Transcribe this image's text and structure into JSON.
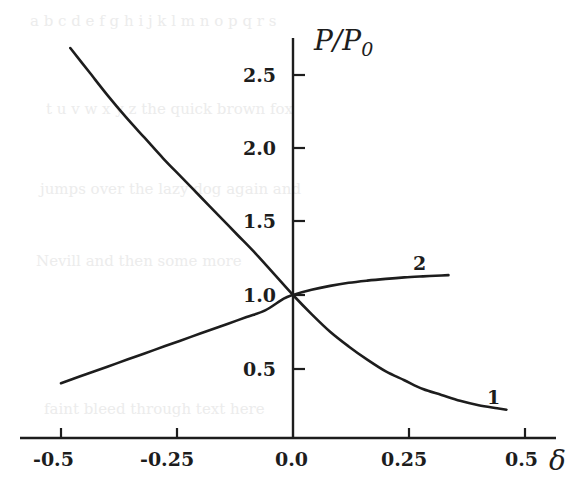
{
  "figure": {
    "background_color": "#ffffff",
    "ink_color": "#1d1d1d",
    "ghost_text_color": "#ececec"
  },
  "axes": {
    "y_title": "P/P",
    "y_title_subscript": "0",
    "x_title": "δ"
  },
  "curve_labels": {
    "curve1": "1",
    "curve2": "2"
  },
  "ghost_lines": [
    "a b c d e f g h i j k l m n o p q r s",
    "t u v w x y z the quick brown fox",
    "jumps over the lazy dog again and",
    "Nevill   and   then   some   more",
    "faint   bleed   through   text   here"
  ],
  "chart_data": {
    "type": "line",
    "title": "",
    "xlabel": "δ",
    "ylabel": "P/P0",
    "xlim": [
      -0.55,
      0.58
    ],
    "ylim": [
      0.0,
      2.8
    ],
    "xticks": [
      -0.5,
      -0.25,
      0.0,
      0.25,
      0.5
    ],
    "xticklabels": [
      "-0.5",
      "-0.25",
      "0.0",
      "0.25",
      "0.5"
    ],
    "yticks": [
      0.5,
      1.0,
      1.5,
      2.0,
      2.5
    ],
    "yticklabels": [
      "0.5",
      "1.0",
      "1.5",
      "2.0",
      "2.5"
    ],
    "grid": false,
    "legend": "inline-end-labels",
    "series": [
      {
        "name": "1",
        "label": "1",
        "label_position": {
          "x": 0.42,
          "y": 0.42
        },
        "x": [
          -0.48,
          -0.44,
          -0.4,
          -0.36,
          -0.32,
          -0.28,
          -0.24,
          -0.2,
          -0.16,
          -0.12,
          -0.08,
          -0.04,
          0.0,
          0.04,
          0.08,
          0.12,
          0.16,
          0.2,
          0.24,
          0.28,
          0.32,
          0.36,
          0.4,
          0.44,
          0.46
        ],
        "y": [
          2.68,
          2.52,
          2.36,
          2.21,
          2.07,
          1.93,
          1.8,
          1.67,
          1.54,
          1.41,
          1.28,
          1.14,
          1.0,
          0.87,
          0.75,
          0.65,
          0.56,
          0.48,
          0.42,
          0.36,
          0.32,
          0.28,
          0.25,
          0.23,
          0.22
        ]
      },
      {
        "name": "2",
        "label": "2",
        "label_position": {
          "x": 0.275,
          "y": 1.28
        },
        "x": [
          -0.5,
          -0.46,
          -0.42,
          -0.38,
          -0.34,
          -0.3,
          -0.26,
          -0.22,
          -0.18,
          -0.14,
          -0.1,
          -0.06,
          -0.02,
          0.0,
          0.04,
          0.08,
          0.12,
          0.16,
          0.2,
          0.24,
          0.28,
          0.32,
          0.335
        ],
        "y": [
          0.4,
          0.445,
          0.49,
          0.535,
          0.58,
          0.625,
          0.67,
          0.715,
          0.76,
          0.805,
          0.85,
          0.895,
          0.975,
          1.0,
          1.035,
          1.062,
          1.083,
          1.098,
          1.11,
          1.12,
          1.127,
          1.133,
          1.135
        ]
      }
    ]
  }
}
